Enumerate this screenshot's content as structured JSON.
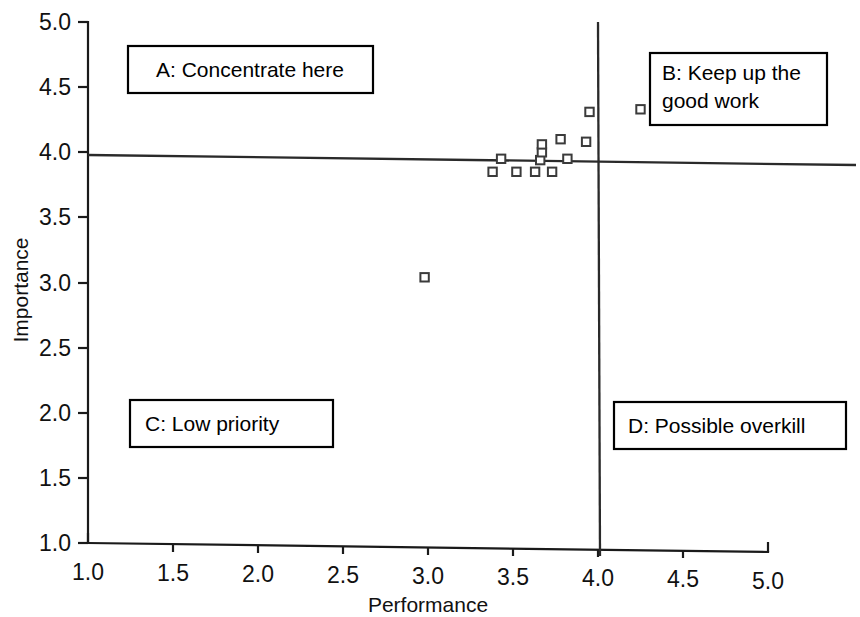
{
  "chart_data": {
    "type": "scatter",
    "title": "",
    "xlabel": "Performance",
    "ylabel": "Importance",
    "xlim": [
      1.0,
      5.0
    ],
    "ylim": [
      1.0,
      5.0
    ],
    "xticks": [
      "1.0",
      "1.5",
      "2.0",
      "2.5",
      "3.0",
      "3.5",
      "4.0",
      "4.5",
      "5.0"
    ],
    "yticks": [
      "1.0",
      "1.5",
      "2.0",
      "2.5",
      "3.0",
      "3.5",
      "4.0",
      "4.5",
      "5.0"
    ],
    "grid": false,
    "legend": "none",
    "marker_style": "open-square",
    "crosshair": {
      "x_value": 4.03,
      "y_value": 3.97,
      "description": "Quadrant divider lines at grand means"
    },
    "points": [
      {
        "x": 2.98,
        "y": 3.04
      },
      {
        "x": 3.38,
        "y": 3.85
      },
      {
        "x": 3.43,
        "y": 3.95
      },
      {
        "x": 3.52,
        "y": 3.85
      },
      {
        "x": 3.63,
        "y": 3.85
      },
      {
        "x": 3.66,
        "y": 3.94
      },
      {
        "x": 3.67,
        "y": 4.0
      },
      {
        "x": 3.67,
        "y": 4.06
      },
      {
        "x": 3.73,
        "y": 3.85
      },
      {
        "x": 3.78,
        "y": 4.1
      },
      {
        "x": 3.82,
        "y": 3.95
      },
      {
        "x": 3.93,
        "y": 4.08
      },
      {
        "x": 3.95,
        "y": 4.31
      },
      {
        "x": 4.25,
        "y": 4.33
      }
    ],
    "quadrants": [
      {
        "id": "A",
        "label": "A: Concentrate here",
        "region": "high-importance low-performance"
      },
      {
        "id": "B",
        "label": "B: Keep up the good work",
        "region": "high-importance high-performance"
      },
      {
        "id": "C",
        "label": "C: Low priority",
        "region": "low-importance low-performance"
      },
      {
        "id": "D",
        "label": "D: Possible overkill",
        "region": "low-importance high-performance"
      }
    ]
  },
  "labels": {
    "quadrant_a": "A: Concentrate here",
    "quadrant_b_line1": "B: Keep up the",
    "quadrant_b_line2": "good work",
    "quadrant_c": "C: Low priority",
    "quadrant_d": "D: Possible overkill"
  },
  "axes": {
    "x_title": "Performance",
    "y_title": "Importance",
    "x_tick_1": "1.0",
    "x_tick_2": "1.5",
    "x_tick_3": "2.0",
    "x_tick_4": "2.5",
    "x_tick_5": "3.0",
    "x_tick_6": "3.5",
    "x_tick_7": "4.0",
    "x_tick_8": "4.5",
    "x_tick_9": "5.0",
    "y_tick_1": "1.0",
    "y_tick_2": "1.5",
    "y_tick_3": "2.0",
    "y_tick_4": "2.5",
    "y_tick_5": "3.0",
    "y_tick_6": "3.5",
    "y_tick_7": "4.0",
    "y_tick_8": "4.5",
    "y_tick_9": "5.0"
  },
  "colors": {
    "background": "#ffffff",
    "axis": "#1a1a1a",
    "marker_stroke": "#3b3b3b",
    "box_border": "#000000"
  }
}
